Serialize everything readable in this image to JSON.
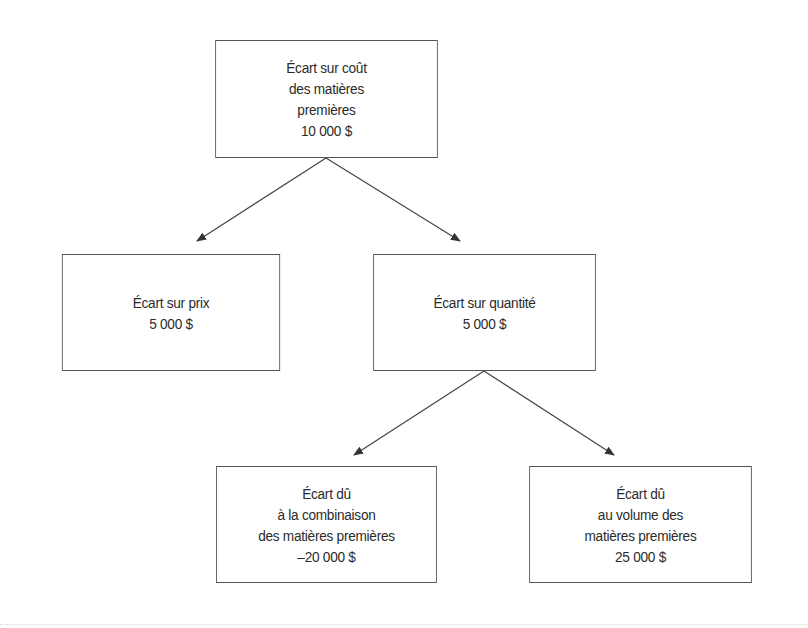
{
  "diagram": {
    "type": "tree",
    "nodes": [
      {
        "id": "root",
        "lines": [
          "Écart sur coût",
          "des matières",
          "premières",
          "10 000 $"
        ],
        "label": "Écart sur coût des matières premières",
        "value": "10 000 $"
      },
      {
        "id": "price",
        "lines": [
          "Écart sur prix",
          "5 000 $"
        ],
        "label": "Écart sur prix",
        "value": "5 000 $"
      },
      {
        "id": "quantity",
        "lines": [
          "Écart sur quantité",
          "5 000 $"
        ],
        "label": "Écart sur quantité",
        "value": "5 000 $"
      },
      {
        "id": "mix",
        "lines": [
          "Écart dû",
          "à la combinaison",
          "des matières premières",
          "–20 000 $"
        ],
        "label": "Écart dû à la combinaison des matières premières",
        "value": "–20 000 $"
      },
      {
        "id": "volume",
        "lines": [
          "Écart dû",
          "au volume des",
          "matières premières",
          "25 000 $"
        ],
        "label": "Écart dû au volume des matières premières",
        "value": "25 000 $"
      }
    ],
    "edges": [
      {
        "from": "root",
        "to": "price"
      },
      {
        "from": "root",
        "to": "quantity"
      },
      {
        "from": "quantity",
        "to": "mix"
      },
      {
        "from": "quantity",
        "to": "volume"
      }
    ],
    "colors": {
      "border": "#555555",
      "text": "#2b2b2b",
      "arrow": "#444444",
      "background": "#ffffff"
    }
  }
}
